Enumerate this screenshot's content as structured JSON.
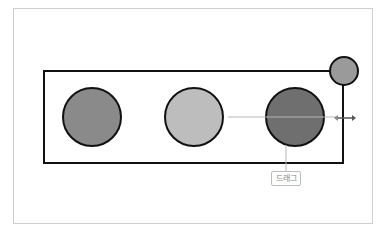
{
  "diagram": {
    "container": {
      "stroke": "#111111"
    },
    "circles": [
      {
        "name": "left-circle",
        "fill": "#8a8a8a"
      },
      {
        "name": "middle-circle",
        "fill": "#bdbdbd"
      },
      {
        "name": "right-circle",
        "fill": "#6f6f6f"
      },
      {
        "name": "corner-handle-circle",
        "fill": "#9a9a9a"
      }
    ],
    "guide_line_color": "#b5b5b5",
    "arrow_color": "#555555",
    "callout": {
      "label": "드래그"
    }
  }
}
